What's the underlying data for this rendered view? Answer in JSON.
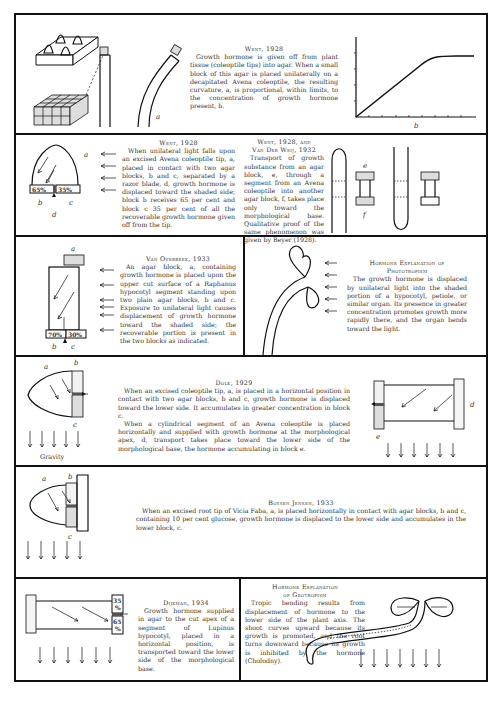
{
  "page": {
    "panels": [
      {
        "id": "went-1928-a",
        "title": "Went, 1928",
        "text": "Growth hormone is given off from plant tissue (coleoptile tips) into agar. When a small block of this agar is placed unilaterally on a decapitated Avena coleoptile, the resulting curvature, a, is proportional, within limits, to the concentration of growth hormone present, b.",
        "labels": [
          "a",
          "b"
        ]
      },
      {
        "id": "went-1928-b",
        "title": "Went, 1928",
        "text": "When unilateral light falls upon an excised Avena coleoptile tip, a, placed in contact with two agar blocks, b and c, separated by a razor blade, d, growth hormone is displaced toward the shaded side; block b receives 65 per cent and block c 35 per cent of all the recoverable growth hormone given off from the tip.",
        "labels": [
          "a",
          "b",
          "c",
          "d"
        ],
        "percentages": [
          "65%",
          "35%"
        ]
      },
      {
        "id": "went-vanderweij",
        "title_line1": "Went, 1928, and",
        "title_line2": "Van Der Weij, 1932",
        "text": "Transport of growth substance from an agar block, e, through a segment from an Avena coleoptile into another agar block, f, takes place only toward the morphological base. Qualitative proof of the same phenomenon was given by Beyer (1928).",
        "labels": [
          "e",
          "f"
        ]
      },
      {
        "id": "van-overbeek-1933",
        "title": "Van Overbeek, 1933",
        "text": "An agar block, a, containing growth hormone is placed upon the upper cut surface of a Raphanus hypocotyl segment standing upon two plain agar blocks, b and c. Exposure to unilateral light causes displacement of growth hormone toward the shaded side; the recoverable portion is present in the two blocks as indicated.",
        "labels": [
          "a",
          "b",
          "c"
        ],
        "percentages": [
          "70%",
          "30%"
        ]
      },
      {
        "id": "phototropism",
        "title_line1": "Hormone Explanation of",
        "title_line2": "Phototropism",
        "text": "The growth hormone is displaced by unilateral light into the shaded portion of a hypocotyl, petiole, or similar organ. Its presence in greater concentration promotes growth more rapidly there, and the organ bends toward the light."
      },
      {
        "id": "dolk-1929",
        "title": "Dolk, 1929",
        "text1": "When an excised coleoptile tip, a, is placed in a horizontal position in contact with two agar blocks, b and c, growth hormone is displaced toward the lower side. It accumulates in greater concentration in block c.",
        "text2": "When a cylindrical segment of an Avena coleoptile is placed horizontally and supplied with growth hormone at the morphological apex, d, transport takes place toward the lower side of the morphological base, the hormone accumulating in block e.",
        "gravity_label": "Gravity",
        "labels": [
          "a",
          "b",
          "c",
          "d",
          "e"
        ]
      },
      {
        "id": "boysen-jensen-1933",
        "title": "Boysen Jensen, 1933",
        "text": "When an excised root tip of Vicia Faba, a, is placed horizontally in contact with agar blocks, b and c, containing 10 per cent glucose, growth hormone is displaced to the lower side and accumulates in the lower block, c.",
        "labels": [
          "a",
          "b",
          "c"
        ]
      },
      {
        "id": "dijkman-1934",
        "title": "Dijkman, 1934",
        "text": "Growth hormone supplied in agar to the cut apex of a segment of Lupinus hypocotyl, placed in a horizontal position, is transported toward the lower side of the morphological base.",
        "percentages": [
          "35%",
          "65%"
        ]
      },
      {
        "id": "geotropism",
        "title_line1": "Hormone Explanation",
        "title_line2": "of Geotropism",
        "text": "Tropic bending results from displacement of hormone to the lower side of the plant axis. The shoot curves upward because its growth is promoted, and the root turns downward because its growth is inhibited by the hormone (Cholodny)."
      }
    ]
  }
}
